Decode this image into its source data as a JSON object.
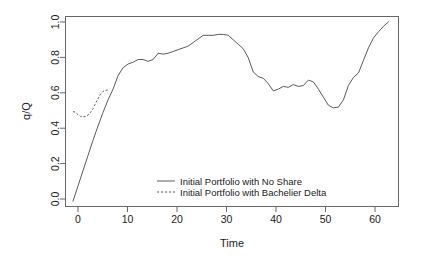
{
  "chart_data": {
    "type": "line",
    "title": "",
    "xlabel": "Time",
    "ylabel": "q/Q",
    "xlim": [
      -1.5,
      65
    ],
    "ylim": [
      -0.03,
      1.03
    ],
    "grid": false,
    "legend_position": "bottom-center",
    "xticks": [
      0,
      10,
      20,
      30,
      40,
      50,
      60
    ],
    "xtick_labels": [
      "0",
      "10",
      "20",
      "30",
      "40",
      "50",
      "60"
    ],
    "yticks": [
      0.0,
      0.2,
      0.4,
      0.6,
      0.8,
      1.0
    ],
    "ytick_labels": [
      "0.0",
      "0.2",
      "0.4",
      "0.6",
      "0.8",
      "1.0"
    ],
    "series": [
      {
        "name": "Initial Portfolio with No Share",
        "style": "solid",
        "color": "#5a5a5a",
        "x": [
          0,
          1,
          2,
          3,
          4,
          5,
          6,
          7,
          8,
          9,
          10,
          11,
          12,
          13,
          14,
          15,
          16,
          17,
          18,
          19,
          20,
          21,
          22,
          23,
          24,
          25,
          26,
          27,
          28,
          29,
          30,
          31,
          32,
          33,
          34,
          35,
          36,
          37,
          38,
          39,
          40,
          41,
          42,
          43,
          44,
          45,
          46,
          47,
          48,
          49,
          50,
          51,
          52,
          53,
          54,
          55,
          56,
          57,
          58,
          59,
          60,
          61,
          62,
          63
        ],
        "y": [
          0.0,
          0.085,
          0.17,
          0.255,
          0.34,
          0.42,
          0.495,
          0.565,
          0.625,
          0.7,
          0.745,
          0.765,
          0.775,
          0.79,
          0.79,
          0.78,
          0.79,
          0.825,
          0.82,
          0.825,
          0.835,
          0.845,
          0.855,
          0.865,
          0.885,
          0.905,
          0.925,
          0.925,
          0.925,
          0.93,
          0.93,
          0.925,
          0.9,
          0.875,
          0.85,
          0.8,
          0.72,
          0.695,
          0.685,
          0.655,
          0.615,
          0.625,
          0.64,
          0.635,
          0.65,
          0.64,
          0.645,
          0.675,
          0.665,
          0.625,
          0.58,
          0.535,
          0.52,
          0.525,
          0.565,
          0.645,
          0.69,
          0.715,
          0.785,
          0.855,
          0.91,
          0.945,
          0.975,
          1.0
        ]
      },
      {
        "name": "Initial Portfolio with Bachelier Delta",
        "style": "dotted",
        "color": "#5a5a5a",
        "x": [
          0,
          0.5,
          1,
          1.5,
          2,
          2.5,
          3,
          3.5,
          4,
          4.5,
          5,
          5.5,
          6,
          6.5,
          7
        ],
        "y": [
          0.5,
          0.495,
          0.482,
          0.473,
          0.47,
          0.472,
          0.48,
          0.495,
          0.515,
          0.545,
          0.572,
          0.597,
          0.612,
          0.618,
          0.62
        ]
      }
    ]
  },
  "legend": {
    "entries": [
      {
        "label": "Initial Portfolio with No Share",
        "style": "solid"
      },
      {
        "label": "Initial Portfolio with Bachelier Delta",
        "style": "dotted"
      }
    ]
  }
}
